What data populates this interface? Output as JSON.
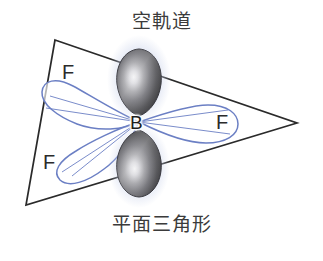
{
  "figure": {
    "title_top": "空軌道",
    "title_bottom": "平面三角形",
    "center_atom": "B",
    "ligands": [
      {
        "label": "F",
        "position": "upper-left"
      },
      {
        "label": "F",
        "position": "right"
      },
      {
        "label": "F",
        "position": "lower-left"
      }
    ],
    "colors": {
      "background": "#ffffff",
      "triangle_outline": "#2a2a2a",
      "orbital_blue": "#6b7fc4",
      "orbital_blue_light": "#aab6dd",
      "p_orbital_dark": "#4a4a4a",
      "p_orbital_darkest": "#2e2e2e",
      "p_orbital_highlight": "#e8e8ec",
      "text": "#3b3b3b"
    },
    "geometry": {
      "shape": "trigonal planar",
      "bond_angle_degrees": 120,
      "hybridization": "sp2",
      "empty_orbital": "p",
      "triangle_vertices": [
        [
          55,
          40
        ],
        [
          297,
          123
        ],
        [
          26,
          205
        ]
      ],
      "center": [
        139,
        122
      ]
    },
    "annotations": {
      "empty_orbital_note": "空軌道",
      "planar_triangle_note": "平面三角形"
    }
  }
}
